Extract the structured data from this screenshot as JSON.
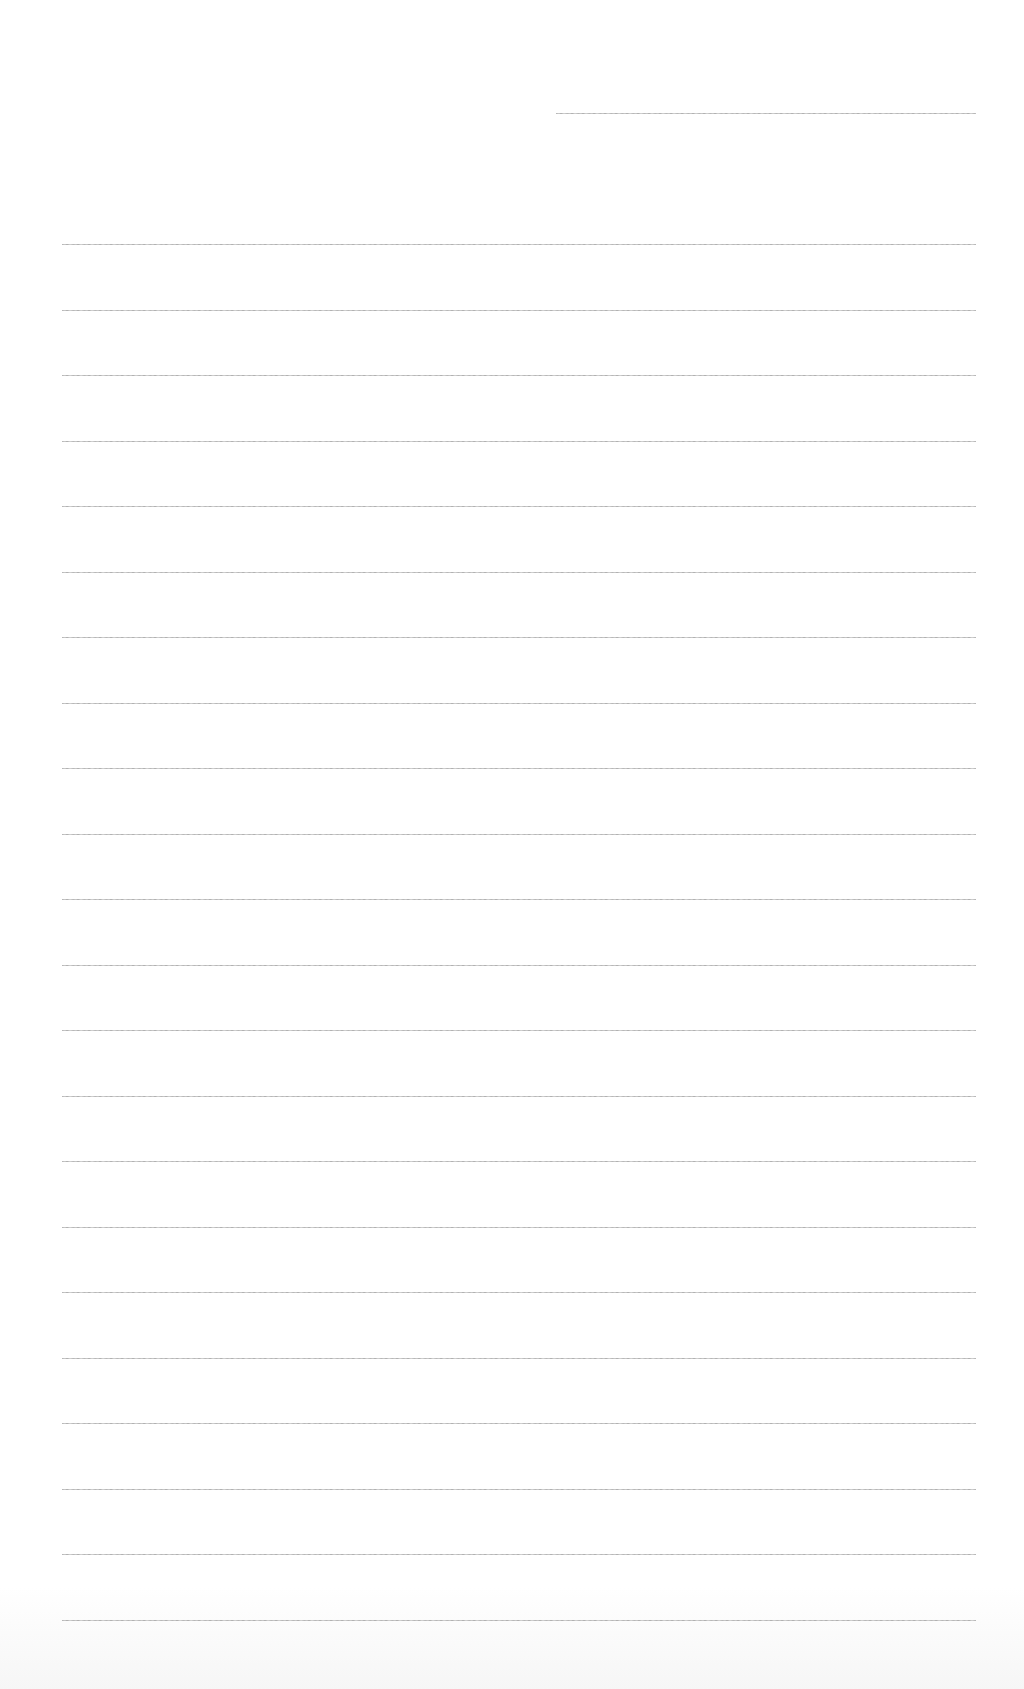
{
  "page": {
    "type": "ruled-paper",
    "background": "#ffffff",
    "rule_color": "#a0a0a0",
    "header_rule": {
      "y": 113,
      "x_start": 556,
      "x_end": 976
    },
    "body_rules": {
      "count": 22,
      "first_y": 244,
      "spacing": 65.5,
      "x_start": 62,
      "x_end": 976
    },
    "text_content": []
  }
}
